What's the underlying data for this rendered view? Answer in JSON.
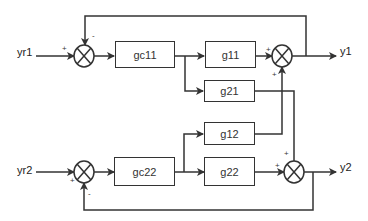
{
  "diagram": {
    "type": "block-diagram",
    "inputs": [
      "yr1",
      "yr2"
    ],
    "outputs": [
      "y1",
      "y2"
    ],
    "blocks": {
      "gc11": "gc11",
      "g11": "g11",
      "g21": "g21",
      "g12": "g12",
      "gc22": "gc22",
      "g22": "g22"
    },
    "signs": {
      "sum1_in": "+",
      "sum1_fb": "-",
      "sum2_g11": "+",
      "sum2_cross": "+",
      "sum3_in": "+",
      "sum3_fb": "-",
      "sum4_g22": "+",
      "sum4_cross": "+"
    },
    "line_color": "#333333"
  }
}
